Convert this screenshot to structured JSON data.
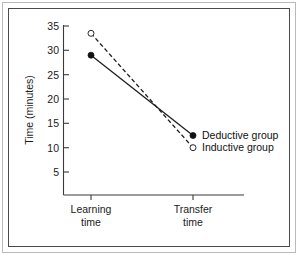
{
  "chart_data": {
    "type": "line",
    "title": "",
    "subtitle": "",
    "xlabel": "",
    "ylabel": "Time (minutes)",
    "categories": [
      "Learning time",
      "Transfer time"
    ],
    "category_lines": [
      [
        "Learning",
        "time"
      ],
      [
        "Transfer",
        "time"
      ]
    ],
    "ylim": [
      0,
      36
    ],
    "yticks": [
      5,
      10,
      15,
      20,
      25,
      30,
      35
    ],
    "ytick_labels": [
      "5",
      "10",
      "15",
      "20",
      "25",
      "30",
      "35"
    ],
    "grid": false,
    "legend_position": "inline-right",
    "series": [
      {
        "name": "Deductive group",
        "values": [
          29,
          12.5
        ],
        "line_style": "solid",
        "marker": "filled-circle",
        "color": "#111111"
      },
      {
        "name": "Inductive group",
        "values": [
          33.5,
          10
        ],
        "line_style": "dashed",
        "marker": "open-circle",
        "color": "#111111"
      }
    ],
    "annotations": [
      {
        "text": "Deductive group",
        "series": "Deductive group"
      },
      {
        "text": "Inductive group",
        "series": "Inductive group"
      }
    ]
  },
  "axis": {
    "y_title": "Time (minutes)",
    "y_tick_labels": [
      "35",
      "30",
      "25",
      "20",
      "15",
      "10",
      "5"
    ],
    "x_tick_label_1_line1": "Learning",
    "x_tick_label_1_line2": "time",
    "x_tick_label_2_line1": "Transfer",
    "x_tick_label_2_line2": "time"
  },
  "legend": {
    "deductive_label": "Deductive group",
    "inductive_label": "Inductive group"
  },
  "colors": {
    "ink": "#111111",
    "axis": "#3b3b3b",
    "frame_outer": "#b9b9b9",
    "frame_inner": "#4a4a4a",
    "background": "#ffffff"
  }
}
